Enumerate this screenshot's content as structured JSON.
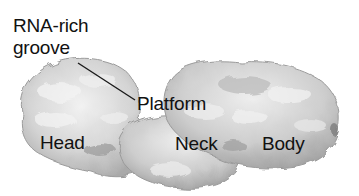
{
  "figure": {
    "labels": {
      "rna_rich_line1": "RNA-rich",
      "rna_rich_line2": "groove",
      "platform": "Platform",
      "head": "Head",
      "neck": "Neck",
      "body": "Body"
    },
    "leader_line": {
      "from": [
        78,
        63
      ],
      "to": [
        135,
        100
      ]
    },
    "colors": {
      "background": "#ffffff",
      "surface_light": "#e6e6e6",
      "surface_mid": "#c4c4c4",
      "surface_dark": "#8a8a8a",
      "text": "#111111"
    }
  }
}
